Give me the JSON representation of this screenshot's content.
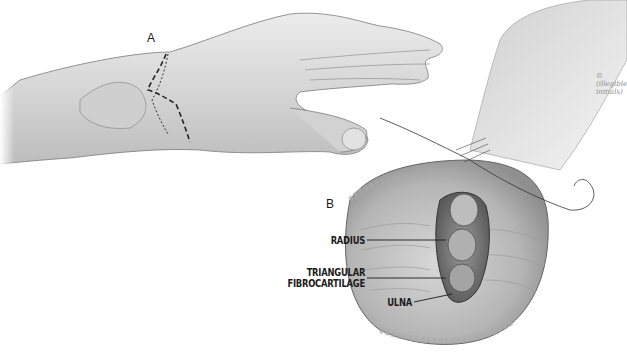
{
  "figure": {
    "panel_a_label": "A",
    "panel_b_label": "B",
    "signature": "© (illegible initials)",
    "labels": {
      "radius": "RADIUS",
      "tfcc_line1": "TRIANGULAR",
      "tfcc_line2": "FIBROCARTILAGE",
      "ulna": "ULNA"
    }
  },
  "colors": {
    "background": "#ffffff",
    "skin_light": "#e4e4e4",
    "skin_mid": "#c6c6c6",
    "skin_dark": "#8a8a8a",
    "ink": "#1c1c1c"
  }
}
